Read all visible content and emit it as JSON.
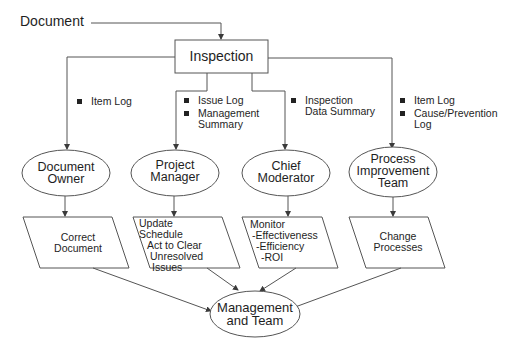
{
  "diagram": {
    "input": {
      "label": "Document"
    },
    "inspection": {
      "label": "Inspection"
    },
    "roles": [
      {
        "id": "document-owner",
        "label_lines": [
          "Document",
          "Owner"
        ],
        "outputs": [
          "Item Log"
        ],
        "action_lines": [
          "Correct",
          "Document"
        ]
      },
      {
        "id": "project-manager",
        "label_lines": [
          "Project",
          "Manager"
        ],
        "outputs": [
          "Issue Log",
          "Management Summary"
        ],
        "output_lines": [
          [
            "Issue Log"
          ],
          [
            "Management",
            "Summary"
          ]
        ],
        "action_lines": [
          "Update",
          "Schedule",
          "Act to Clear",
          "Unresolved",
          "Issues"
        ]
      },
      {
        "id": "chief-moderator",
        "label_lines": [
          "Chief",
          "Moderator"
        ],
        "outputs": [
          "Inspection Data Summary"
        ],
        "output_lines": [
          [
            "Inspection",
            "Data Summary"
          ]
        ],
        "action_lines": [
          "Monitor",
          "-Effectiveness",
          "-Efficiency",
          "-ROI"
        ]
      },
      {
        "id": "process-improvement-team",
        "label_lines": [
          "Process",
          "Improvement",
          "Team"
        ],
        "outputs": [
          "Item Log",
          "Cause/Prevention Log"
        ],
        "output_lines": [
          [
            "Item Log"
          ],
          [
            "Cause/Prevention",
            "Log"
          ]
        ],
        "action_lines": [
          "Change",
          "Processes"
        ]
      }
    ],
    "sink": {
      "label_lines": [
        "Management",
        "and Team"
      ]
    },
    "colors": {
      "stroke": "#4a4a4a",
      "text": "#1e1e1e",
      "background": "#ffffff"
    }
  }
}
